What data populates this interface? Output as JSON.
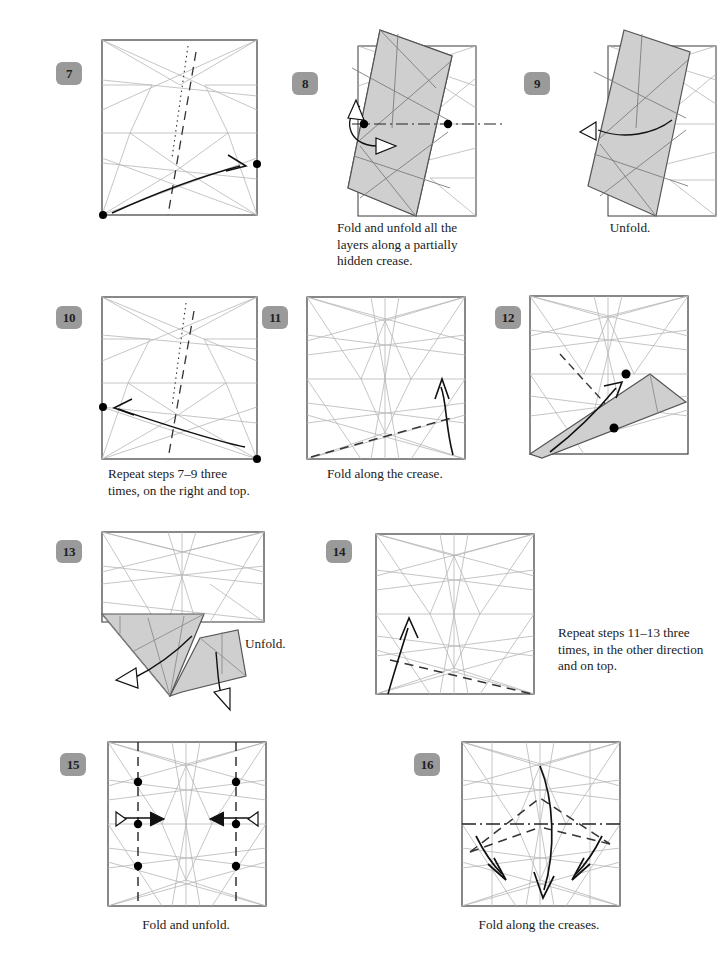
{
  "page": {
    "kind": "origami-instruction-diagram",
    "width": 724,
    "height": 954,
    "background": "#ffffff",
    "colors": {
      "badge_fill": "#9a9a9a",
      "badge_text": "#1f1f1f",
      "paper_edge": "#3a3a3a",
      "crease_light": "#b6b6b6",
      "crease_mid": "#8d8d8d",
      "shaded_face": "#cfcfcf",
      "shaded_face_edge": "#555555",
      "arrow": "#111111",
      "dot": "#000000",
      "caption_text": "#1a1a1a"
    }
  },
  "steps": [
    {
      "number": "7",
      "caption": "",
      "notes": "square crease pattern, dotted line, dashed valley fold, curved fold arrow from bottom-left dot to right-edge dot",
      "markers": 2
    },
    {
      "number": "8",
      "caption": "Fold and unfold all the layers along a partially hidden crease.",
      "notes": "tilted shaded folded shape with dash-dot mountain crease across, two dots, small fold-and-unfold arrow pair",
      "markers": 2
    },
    {
      "number": "9",
      "caption": "Unfold.",
      "notes": "tilted shaded folded shape with single unfold arrow pointing left",
      "markers": 0
    },
    {
      "number": "10",
      "caption": "Repeat steps 7–9 three times, on the right and top.",
      "notes": "square crease pattern, dotted line, dashed valley fold, curved arrow from bottom-right dot to left-edge dot",
      "markers": 2
    },
    {
      "number": "11",
      "caption": "Fold along the crease.",
      "notes": "dense square crease pattern with dashed valley fold near bottom-left and upward fold arrow at right",
      "markers": 0
    },
    {
      "number": "12",
      "caption": "",
      "notes": "square crease pattern with shaded triangular flap folded up from bottom-right, dashed crease, curved arrow, two dots",
      "markers": 2
    },
    {
      "number": "13",
      "caption": "Unfold.",
      "notes": "square with two shaded flaps protruding below-left, two unfold arrows",
      "markers": 0
    },
    {
      "number": "14",
      "caption": "Repeat steps 11–13 three times, in the other direction and on top.",
      "notes": "dense square crease pattern with dashed valley fold and upward arrow at left",
      "markers": 0
    },
    {
      "number": "15",
      "caption": "Fold and unfold.",
      "notes": "square crease pattern with two vertical dashed creases, six dots, two double-headed fold-and-unfold arrows",
      "markers": 6
    },
    {
      "number": "16",
      "caption": "Fold along the creases.",
      "notes": "dense square crease pattern with dash-dot horizontal mountain line, dashed valley creases and four fold arrows",
      "markers": 0
    }
  ]
}
